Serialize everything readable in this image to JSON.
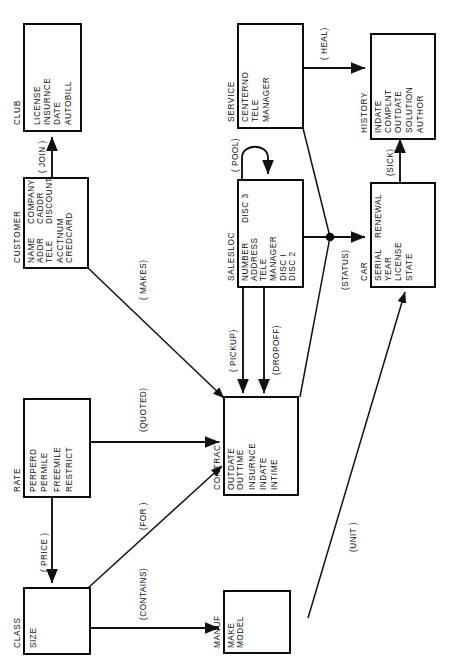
{
  "diagram": {
    "orientation": "rotated-90-ccw",
    "page_background": "#ffffff",
    "line_color": "#111111",
    "entities": [
      {
        "id": "club",
        "name": "CLUB",
        "attributes_col1": [
          "LICENSE",
          "INSURNCE",
          "DATE",
          "AUTOBILL"
        ],
        "attributes_col2": []
      },
      {
        "id": "customer",
        "name": "CUSTOMER",
        "attributes_col1": [
          "NAME",
          "ADDR",
          "TELE",
          "ACCTNUM",
          "CREDCARD"
        ],
        "attributes_col2": [
          "COMPANY",
          "CADDR",
          "DISCOUNT"
        ]
      },
      {
        "id": "service",
        "name": "SERVICE",
        "attributes_col1": [
          "CENTERNO",
          "TELE",
          "MANAGER"
        ],
        "attributes_col2": []
      },
      {
        "id": "salesloc",
        "name": "SALESLOC",
        "attributes_col1": [
          "NUMBER",
          "ADDRESS",
          "TELE",
          "MANAGER",
          "DISC I",
          "DISC 2"
        ],
        "attributes_col2": [
          "DISC 3"
        ]
      },
      {
        "id": "history",
        "name": "HISTORY",
        "attributes_col1": [
          "INDATE",
          "COMPLNT",
          "OUTDATE",
          "SOLUTION",
          "AUTHOR"
        ],
        "attributes_col2": []
      },
      {
        "id": "car",
        "name": "CAR",
        "attributes_col1": [
          "SERIAL",
          "YEAR",
          "LICENSE",
          "STATE"
        ],
        "attributes_col2": [
          "RENEWAL"
        ]
      },
      {
        "id": "rate",
        "name": "RATE",
        "attributes_col1": [
          "PERPERD",
          "PERMILE",
          "FREEMILE",
          "RESTRICT"
        ],
        "attributes_col2": []
      },
      {
        "id": "contract",
        "name": "CONTRACT",
        "attributes_col1": [
          "OUTDATE",
          "OUTTIME",
          "INSURNCE",
          "INDATE",
          "INTIME"
        ],
        "attributes_col2": []
      },
      {
        "id": "class",
        "name": "CLASS",
        "attributes_col1": [
          "SIZE"
        ],
        "attributes_col2": []
      },
      {
        "id": "manuf",
        "name": "MANUF",
        "attributes_col1": [
          "MAKE",
          "MODEL"
        ],
        "attributes_col2": []
      }
    ],
    "relationships": [
      {
        "id": "join",
        "label": "( JOIN )",
        "from": "CUSTOMER",
        "to": "CLUB"
      },
      {
        "id": "makes",
        "label": "( MAKES)",
        "from": "CUSTOMER",
        "to": "CONTRACT"
      },
      {
        "id": "heal",
        "label": "( HEAL)",
        "from": "SERVICE",
        "to": "HISTORY"
      },
      {
        "id": "pool",
        "label": "( POOL)",
        "from": "SALESLOC",
        "to": "SALESLOC"
      },
      {
        "id": "status",
        "label": "(STATUS)",
        "from": "SALESLOC",
        "to": "CAR"
      },
      {
        "id": "sick",
        "label": "(SICK)",
        "from": "CAR",
        "to": "HISTORY"
      },
      {
        "id": "pickup",
        "label": "( PICKUP)",
        "from": "SALESLOC",
        "to": "CONTRACT"
      },
      {
        "id": "dropoff",
        "label": "(DROPOFF)",
        "from": "SALESLOC",
        "to": "CONTRACT"
      },
      {
        "id": "quoted",
        "label": "(QUOTED)",
        "from": "RATE",
        "to": "CONTRACT"
      },
      {
        "id": "price",
        "label": "( PRICE )",
        "from": "RATE",
        "to": "CLASS"
      },
      {
        "id": "for",
        "label": "(FOR )",
        "from": "CLASS",
        "to": "CONTRACT"
      },
      {
        "id": "contains",
        "label": "(CONTAINS)",
        "from": "CLASS",
        "to": "MANUF"
      },
      {
        "id": "unit",
        "label": "(UNIT )",
        "from": "MANUF",
        "to": "CAR"
      }
    ]
  }
}
